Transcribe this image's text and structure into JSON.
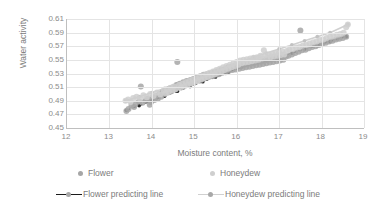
{
  "chart_data": {
    "type": "scatter",
    "title": "",
    "xlabel": "Moisture content, %",
    "ylabel": "Water activity",
    "xlim": [
      12,
      19
    ],
    "ylim": [
      0.45,
      0.61
    ],
    "xticks": [
      12,
      13,
      14,
      15,
      16,
      17,
      18,
      19
    ],
    "yticks": [
      0.45,
      0.47,
      0.49,
      0.51,
      0.53,
      0.55,
      0.57,
      0.59,
      0.61
    ],
    "xtick_labels": [
      "12",
      "13",
      "14",
      "15",
      "16",
      "17",
      "18",
      "19"
    ],
    "ytick_labels": [
      "0.45",
      "0.47",
      "0.49",
      "0.51",
      "0.53",
      "0.55",
      "0.57",
      "0.59",
      "0.61"
    ],
    "grid": "horizontal-and-vertical",
    "legend_position": "bottom",
    "colors": {
      "flower_points": "#a6a6a6",
      "honeydew_points": "#cfcfcf",
      "flower_line": "#1a1a1a",
      "honeydew_line": "#d0d0d0",
      "gridline": "#e4e4e4",
      "axis": "#bfbfbf",
      "text": "#7b7b7b"
    },
    "series": [
      {
        "name": "Flower",
        "type": "scatter",
        "color": "#a6a6a6",
        "points": [
          [
            13.4,
            0.475
          ],
          [
            13.45,
            0.478
          ],
          [
            13.52,
            0.483
          ],
          [
            13.58,
            0.481
          ],
          [
            13.62,
            0.486
          ],
          [
            13.7,
            0.489
          ],
          [
            13.74,
            0.511
          ],
          [
            13.78,
            0.487
          ],
          [
            13.85,
            0.49
          ],
          [
            13.9,
            0.493
          ],
          [
            13.95,
            0.484
          ],
          [
            13.98,
            0.488
          ],
          [
            14.02,
            0.495
          ],
          [
            14.06,
            0.491
          ],
          [
            14.1,
            0.497
          ],
          [
            14.14,
            0.493
          ],
          [
            14.18,
            0.5
          ],
          [
            14.22,
            0.496
          ],
          [
            14.26,
            0.503
          ],
          [
            14.3,
            0.5
          ],
          [
            14.34,
            0.506
          ],
          [
            14.38,
            0.502
          ],
          [
            14.42,
            0.508
          ],
          [
            14.46,
            0.504
          ],
          [
            14.5,
            0.51
          ],
          [
            14.54,
            0.507
          ],
          [
            14.58,
            0.513
          ],
          [
            14.6,
            0.547
          ],
          [
            14.62,
            0.509
          ],
          [
            14.66,
            0.515
          ],
          [
            14.7,
            0.511
          ],
          [
            14.74,
            0.517
          ],
          [
            14.78,
            0.513
          ],
          [
            14.82,
            0.519
          ],
          [
            14.86,
            0.515
          ],
          [
            14.9,
            0.52
          ],
          [
            14.94,
            0.516
          ],
          [
            14.98,
            0.522
          ],
          [
            15.02,
            0.518
          ],
          [
            15.06,
            0.524
          ],
          [
            15.1,
            0.52
          ],
          [
            15.14,
            0.526
          ],
          [
            15.18,
            0.522
          ],
          [
            15.22,
            0.528
          ],
          [
            15.26,
            0.524
          ],
          [
            15.3,
            0.529
          ],
          [
            15.34,
            0.525
          ],
          [
            15.38,
            0.53
          ],
          [
            15.42,
            0.526
          ],
          [
            15.46,
            0.532
          ],
          [
            15.5,
            0.528
          ],
          [
            15.54,
            0.533
          ],
          [
            15.58,
            0.529
          ],
          [
            15.62,
            0.535
          ],
          [
            15.66,
            0.531
          ],
          [
            15.7,
            0.536
          ],
          [
            15.74,
            0.532
          ],
          [
            15.78,
            0.538
          ],
          [
            15.82,
            0.534
          ],
          [
            15.86,
            0.539
          ],
          [
            15.9,
            0.535
          ],
          [
            15.94,
            0.54
          ],
          [
            15.98,
            0.536
          ],
          [
            16.02,
            0.541
          ],
          [
            16.06,
            0.537
          ],
          [
            16.1,
            0.542
          ],
          [
            16.14,
            0.538
          ],
          [
            16.18,
            0.543
          ],
          [
            16.22,
            0.539
          ],
          [
            16.26,
            0.544
          ],
          [
            16.3,
            0.54
          ],
          [
            16.34,
            0.545
          ],
          [
            16.38,
            0.541
          ],
          [
            16.42,
            0.546
          ],
          [
            16.46,
            0.542
          ],
          [
            16.5,
            0.547
          ],
          [
            16.54,
            0.543
          ],
          [
            16.58,
            0.548
          ],
          [
            16.62,
            0.544
          ],
          [
            16.66,
            0.549
          ],
          [
            16.7,
            0.545
          ],
          [
            16.74,
            0.55
          ],
          [
            16.78,
            0.546
          ],
          [
            16.82,
            0.551
          ],
          [
            16.86,
            0.547
          ],
          [
            16.9,
            0.552
          ],
          [
            16.94,
            0.548
          ],
          [
            16.98,
            0.553
          ],
          [
            17.02,
            0.549
          ],
          [
            17.06,
            0.554
          ],
          [
            17.1,
            0.55
          ],
          [
            17.16,
            0.555
          ],
          [
            17.22,
            0.556
          ],
          [
            17.3,
            0.558
          ],
          [
            17.38,
            0.56
          ],
          [
            17.46,
            0.562
          ],
          [
            17.5,
            0.593
          ],
          [
            17.54,
            0.564
          ],
          [
            17.62,
            0.565
          ],
          [
            17.7,
            0.567
          ],
          [
            17.78,
            0.569
          ],
          [
            17.86,
            0.57
          ],
          [
            17.94,
            0.572
          ],
          [
            18.02,
            0.574
          ],
          [
            18.1,
            0.575
          ],
          [
            18.18,
            0.577
          ],
          [
            18.26,
            0.578
          ],
          [
            18.34,
            0.58
          ],
          [
            18.42,
            0.581
          ],
          [
            18.5,
            0.582
          ],
          [
            18.58,
            0.584
          ]
        ]
      },
      {
        "name": "Honeydew",
        "type": "scatter",
        "color": "#cfcfcf",
        "points": [
          [
            13.38,
            0.49
          ],
          [
            13.44,
            0.492
          ],
          [
            13.5,
            0.488
          ],
          [
            13.56,
            0.494
          ],
          [
            13.64,
            0.496
          ],
          [
            13.72,
            0.493
          ],
          [
            13.8,
            0.498
          ],
          [
            13.88,
            0.495
          ],
          [
            13.96,
            0.5
          ],
          [
            14.04,
            0.497
          ],
          [
            14.12,
            0.502
          ],
          [
            14.2,
            0.499
          ],
          [
            14.28,
            0.505
          ],
          [
            14.32,
            0.501
          ],
          [
            14.36,
            0.507
          ],
          [
            14.4,
            0.503
          ],
          [
            14.44,
            0.509
          ],
          [
            14.48,
            0.505
          ],
          [
            14.52,
            0.511
          ],
          [
            14.56,
            0.507
          ],
          [
            14.64,
            0.513
          ],
          [
            14.68,
            0.509
          ],
          [
            14.72,
            0.515
          ],
          [
            14.76,
            0.511
          ],
          [
            14.8,
            0.517
          ],
          [
            14.84,
            0.513
          ],
          [
            14.88,
            0.519
          ],
          [
            14.92,
            0.515
          ],
          [
            14.96,
            0.521
          ],
          [
            15.0,
            0.517
          ],
          [
            15.04,
            0.523
          ],
          [
            15.08,
            0.519
          ],
          [
            15.12,
            0.525
          ],
          [
            15.16,
            0.521
          ],
          [
            15.2,
            0.527
          ],
          [
            15.24,
            0.523
          ],
          [
            15.28,
            0.529
          ],
          [
            15.32,
            0.525
          ],
          [
            15.36,
            0.531
          ],
          [
            15.4,
            0.527
          ],
          [
            15.44,
            0.533
          ],
          [
            15.48,
            0.529
          ],
          [
            15.52,
            0.535
          ],
          [
            15.56,
            0.531
          ],
          [
            15.6,
            0.537
          ],
          [
            15.64,
            0.533
          ],
          [
            15.68,
            0.539
          ],
          [
            15.72,
            0.535
          ],
          [
            15.76,
            0.541
          ],
          [
            15.8,
            0.537
          ],
          [
            15.84,
            0.543
          ],
          [
            15.88,
            0.539
          ],
          [
            15.92,
            0.545
          ],
          [
            15.96,
            0.541
          ],
          [
            16.0,
            0.547
          ],
          [
            16.04,
            0.543
          ],
          [
            16.08,
            0.549
          ],
          [
            16.12,
            0.545
          ],
          [
            16.16,
            0.55
          ],
          [
            16.2,
            0.546
          ],
          [
            16.24,
            0.551
          ],
          [
            16.28,
            0.547
          ],
          [
            16.32,
            0.552
          ],
          [
            16.36,
            0.548
          ],
          [
            16.4,
            0.553
          ],
          [
            16.44,
            0.549
          ],
          [
            16.48,
            0.554
          ],
          [
            16.52,
            0.55
          ],
          [
            16.56,
            0.556
          ],
          [
            16.6,
            0.552
          ],
          [
            16.64,
            0.564
          ],
          [
            16.68,
            0.557
          ],
          [
            16.72,
            0.553
          ],
          [
            16.76,
            0.558
          ],
          [
            16.8,
            0.554
          ],
          [
            16.84,
            0.559
          ],
          [
            16.88,
            0.555
          ],
          [
            16.92,
            0.56
          ],
          [
            16.96,
            0.556
          ],
          [
            17.0,
            0.561
          ],
          [
            17.04,
            0.557
          ],
          [
            17.08,
            0.562
          ],
          [
            17.12,
            0.558
          ],
          [
            17.18,
            0.563
          ],
          [
            17.24,
            0.565
          ],
          [
            17.32,
            0.566
          ],
          [
            17.4,
            0.568
          ],
          [
            17.48,
            0.569
          ],
          [
            17.56,
            0.571
          ],
          [
            17.64,
            0.572
          ],
          [
            17.72,
            0.574
          ],
          [
            17.8,
            0.576
          ],
          [
            17.88,
            0.577
          ],
          [
            17.96,
            0.579
          ],
          [
            18.04,
            0.58
          ],
          [
            18.12,
            0.582
          ],
          [
            18.2,
            0.584
          ],
          [
            18.28,
            0.585
          ],
          [
            18.36,
            0.587
          ],
          [
            18.44,
            0.588
          ],
          [
            18.52,
            0.59
          ],
          [
            18.58,
            0.598
          ],
          [
            18.62,
            0.602
          ]
        ]
      },
      {
        "name": "Flower predicting line",
        "type": "line",
        "color": "#1a1a1a",
        "style": "dashed-with-markers",
        "points": [
          [
            13.4,
            0.476
          ],
          [
            13.7,
            0.483
          ],
          [
            14.0,
            0.49
          ],
          [
            14.3,
            0.497
          ],
          [
            14.6,
            0.504
          ],
          [
            14.9,
            0.511
          ],
          [
            15.2,
            0.518
          ],
          [
            15.5,
            0.525
          ],
          [
            15.8,
            0.532
          ],
          [
            16.1,
            0.539
          ],
          [
            16.4,
            0.545
          ],
          [
            16.7,
            0.55
          ],
          [
            17.0,
            0.5545
          ],
          [
            17.3,
            0.56
          ],
          [
            17.6,
            0.566
          ],
          [
            17.9,
            0.571
          ],
          [
            18.2,
            0.577
          ],
          [
            18.58,
            0.584
          ]
        ]
      },
      {
        "name": "Honeydew predicting line",
        "type": "line",
        "color": "#d0d0d0",
        "style": "solid-with-markers",
        "points": [
          [
            13.38,
            0.49
          ],
          [
            13.7,
            0.496
          ],
          [
            14.0,
            0.502
          ],
          [
            14.3,
            0.508
          ],
          [
            14.6,
            0.515
          ],
          [
            14.9,
            0.5215
          ],
          [
            15.2,
            0.528
          ],
          [
            15.5,
            0.5345
          ],
          [
            15.8,
            0.541
          ],
          [
            16.1,
            0.5475
          ],
          [
            16.4,
            0.554
          ],
          [
            16.7,
            0.56
          ],
          [
            17.0,
            0.566
          ],
          [
            17.3,
            0.572
          ],
          [
            17.6,
            0.578
          ],
          [
            17.9,
            0.584
          ],
          [
            18.2,
            0.59
          ],
          [
            18.62,
            0.602
          ]
        ]
      }
    ],
    "legend": [
      {
        "label": "Flower",
        "marker": "dot",
        "color": "#a6a6a6"
      },
      {
        "label": "Honeydew",
        "marker": "dot",
        "color": "#cfcfcf"
      },
      {
        "label": "Flower predicting line",
        "marker": "line-dot",
        "color": "#1a1a1a"
      },
      {
        "label": "Honeydew predicting line",
        "marker": "line-dot",
        "color": "#d0d0d0"
      }
    ]
  }
}
